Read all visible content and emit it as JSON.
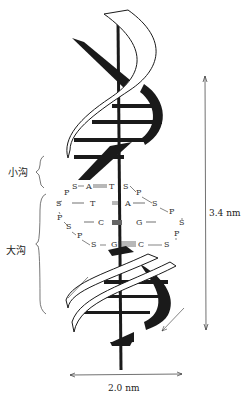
{
  "diagram": {
    "minor_groove_label": "小沟",
    "major_groove_label": "大沟",
    "pitch_label": "3.4 nm",
    "diameter_label": "2.0 nm",
    "base_pairs": [
      {
        "left": "A",
        "right": "T",
        "bond": "="
      },
      {
        "left": "T",
        "right": "A",
        "bond": "="
      },
      {
        "left": "C",
        "right": "G",
        "bond": "≡"
      },
      {
        "left": "G",
        "right": "C",
        "bond": "≡"
      }
    ],
    "backbone_sugar": "S",
    "backbone_phosphate": "P",
    "colors": {
      "ink": "#1a1a1a",
      "ribbon_fill": "#ffffff",
      "background": "#ffffff"
    }
  }
}
